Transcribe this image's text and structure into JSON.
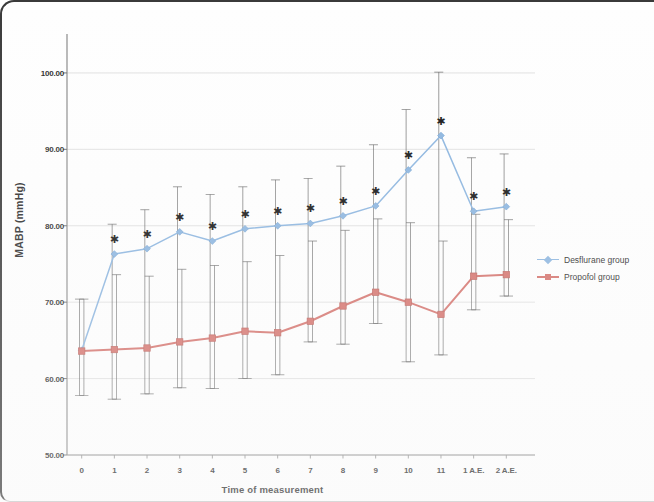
{
  "chart_data": {
    "type": "line",
    "title": "",
    "xlabel": "Time of measurement",
    "ylabel": "MABP (mmHg)",
    "categories": [
      "0",
      "1",
      "2",
      "3",
      "4",
      "5",
      "6",
      "7",
      "8",
      "9",
      "10",
      "11",
      "1 A.E.",
      "2 A.E."
    ],
    "ylim": [
      50,
      103
    ],
    "yticks": [
      50,
      60,
      70,
      80,
      90,
      100
    ],
    "ytick_labels": [
      "50.00",
      "60.00",
      "70.00",
      "80.00",
      "90.00",
      "100.00"
    ],
    "grid": true,
    "legend_position": "right",
    "series": [
      {
        "name": "Desflurane group",
        "color": "#8ab4df",
        "marker": "diamond",
        "values": [
          63.7,
          76.3,
          77.0,
          79.2,
          78.0,
          79.6,
          80.0,
          80.3,
          81.3,
          82.6,
          87.3,
          91.8,
          81.9,
          82.5
        ],
        "err_low": [
          57.8,
          57.3,
          58.0,
          58.8,
          58.7,
          60.0,
          60.5,
          64.8,
          64.5,
          67.2,
          62.2,
          63.1,
          69.0,
          70.8
        ],
        "err_high": [
          70.4,
          80.2,
          82.1,
          85.1,
          84.1,
          85.1,
          86.0,
          86.2,
          87.8,
          90.6,
          95.2,
          100.1,
          88.9,
          89.4
        ],
        "significance_markers": [
          false,
          true,
          true,
          true,
          true,
          true,
          true,
          true,
          true,
          true,
          true,
          true,
          true,
          true
        ]
      },
      {
        "name": "Propofol group",
        "color": "#d4706a",
        "marker": "square",
        "values": [
          63.6,
          63.8,
          64.0,
          64.8,
          65.3,
          66.2,
          66.0,
          67.5,
          69.5,
          71.3,
          70.0,
          68.4,
          73.4,
          73.6
        ],
        "err_low": [
          57.8,
          57.3,
          58.0,
          58.8,
          58.7,
          60.0,
          60.5,
          64.8,
          64.5,
          67.2,
          62.2,
          63.1,
          69.0,
          70.8
        ],
        "err_high": [
          70.4,
          73.6,
          73.4,
          74.3,
          74.8,
          75.3,
          76.1,
          78.0,
          79.4,
          80.9,
          80.4,
          78.0,
          81.5,
          80.8
        ],
        "significance_markers": [
          false,
          false,
          false,
          false,
          false,
          false,
          false,
          false,
          false,
          false,
          false,
          false,
          false,
          false
        ]
      }
    ],
    "significance_symbol": "✱"
  },
  "legend": {
    "items": [
      {
        "label": "Desflurane group"
      },
      {
        "label": "Propofol group"
      }
    ]
  },
  "colors": {
    "desflurane": "#8ab4df",
    "propofol": "#d4706a",
    "errorbar": "#5a5a5a",
    "grid": "#d9d9d9",
    "axis": "#9a9a9a",
    "text": "#2b2b2b"
  }
}
